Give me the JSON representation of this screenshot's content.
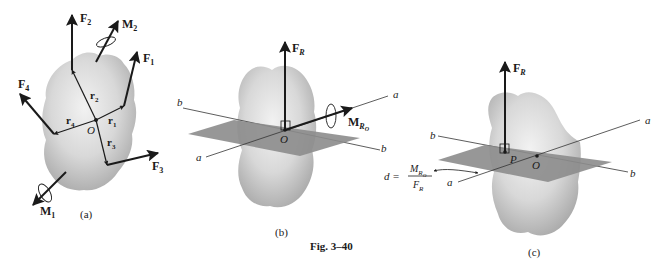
{
  "figure": {
    "caption": "Fig. 3–40",
    "colors": {
      "body_fill": "#cfcfcf",
      "body_light": "#eeeeee",
      "plane_fill": "#8c8c8c",
      "ink": "#1a1a1a"
    },
    "panels": [
      {
        "id": "a",
        "label": "(a)",
        "forces": [
          {
            "name": "F",
            "sub": "1"
          },
          {
            "name": "F",
            "sub": "2"
          },
          {
            "name": "F",
            "sub": "3"
          },
          {
            "name": "F",
            "sub": "4"
          }
        ],
        "position_vectors": [
          {
            "name": "r",
            "sub": "1"
          },
          {
            "name": "r",
            "sub": "2"
          },
          {
            "name": "r",
            "sub": "3"
          },
          {
            "name": "r",
            "sub": "4"
          }
        ],
        "moments": [
          {
            "name": "M",
            "sub": "1"
          },
          {
            "name": "M",
            "sub": "2"
          }
        ],
        "origin": "O"
      },
      {
        "id": "b",
        "label": "(b)",
        "resultant_force": {
          "name": "F",
          "sub": "R"
        },
        "resultant_moment": {
          "name": "M",
          "sub": "R",
          "subsub": "O"
        },
        "axes": [
          "a",
          "a",
          "b",
          "b"
        ],
        "origin": "O"
      },
      {
        "id": "c",
        "label": "(c)",
        "resultant_force": {
          "name": "F",
          "sub": "R"
        },
        "axes": [
          "a",
          "a",
          "b",
          "b"
        ],
        "origin": "O",
        "point": "P",
        "distance_formula": {
          "lhs": "d =",
          "numerator": "M",
          "numerator_sub": "R",
          "numerator_subsub": "O",
          "denominator": "F",
          "denominator_sub": "R"
        }
      }
    ]
  }
}
